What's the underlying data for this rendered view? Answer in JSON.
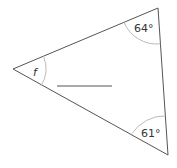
{
  "diagram": {
    "type": "triangle-angles",
    "vertices": {
      "left": {
        "x": 13,
        "y": 69
      },
      "top_right": {
        "x": 158,
        "y": 8
      },
      "bottom_right": {
        "x": 168,
        "y": 155
      }
    },
    "angles": {
      "left": "f",
      "top_right": "64°",
      "bottom_right": "61°"
    },
    "answer_line": {
      "x1": 57,
      "y1": 86,
      "x2": 112,
      "y2": 86
    },
    "colors": {
      "edge": "#555555",
      "arc": "#bbbbbb",
      "text": "#333333"
    }
  }
}
